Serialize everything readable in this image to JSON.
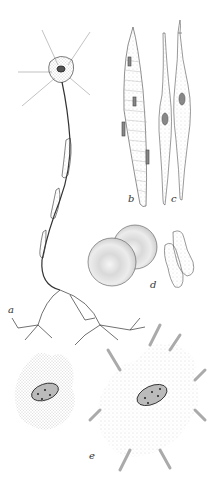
{
  "figure": {
    "labels": {
      "a": "a",
      "b": "b",
      "c": "c",
      "d": "d",
      "e": "e"
    },
    "panels": [
      {
        "id": "a",
        "subject": "neuron with long myelinated axon and branching terminals"
      },
      {
        "id": "b",
        "subject": "striated spindle-shaped muscle cell"
      },
      {
        "id": "c",
        "subject": "two smooth muscle cells with nuclei"
      },
      {
        "id": "d",
        "subject": "red blood cells, face and side view"
      },
      {
        "id": "e",
        "subject": "two pigment cells (melanophores) with nuclei, contracted and expanded"
      }
    ],
    "colors": {
      "ink": "#333333",
      "stipple": "#9a9a9a",
      "background": "#ffffff"
    }
  }
}
